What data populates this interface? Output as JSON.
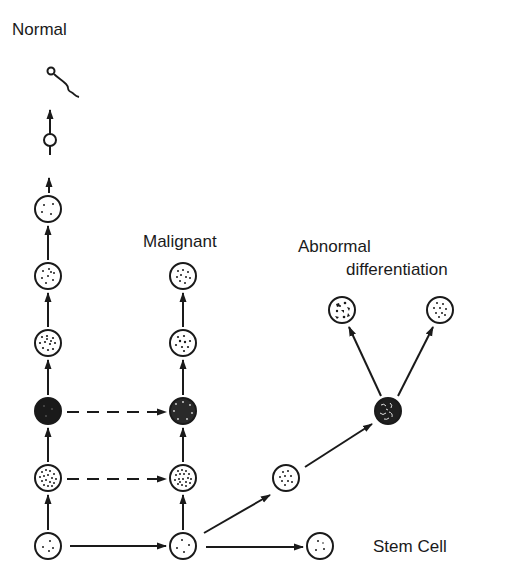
{
  "labels": {
    "normal": "Normal",
    "malignant": "Malignant",
    "abnormal_line1": "Abnormal",
    "abnormal_line2": "differentiation",
    "stem_cell": "Stem Cell"
  },
  "colors": {
    "ink": "#1a1a1a",
    "background": "#ffffff"
  },
  "nodes": [
    {
      "id": "sperm",
      "column": "normal",
      "type": "sperm-cell",
      "x": 49,
      "y": 100
    },
    {
      "id": "n1",
      "column": "normal",
      "type": "small-empty",
      "x": 50,
      "y": 168
    },
    {
      "id": "n2",
      "column": "normal",
      "type": "sparse-dots",
      "x": 48,
      "y": 209
    },
    {
      "id": "n3",
      "column": "normal",
      "type": "light-dots",
      "x": 48,
      "y": 276
    },
    {
      "id": "n4",
      "column": "normal",
      "type": "medium-dots",
      "x": 48,
      "y": 343
    },
    {
      "id": "n5",
      "column": "normal",
      "type": "solid-dark",
      "x": 48,
      "y": 411
    },
    {
      "id": "n6",
      "column": "normal",
      "type": "dense-dots",
      "x": 48,
      "y": 478
    },
    {
      "id": "n7",
      "column": "normal",
      "type": "stem",
      "x": 48,
      "y": 546
    },
    {
      "id": "m1",
      "column": "malignant",
      "type": "light-dots",
      "x": 183,
      "y": 276
    },
    {
      "id": "m2",
      "column": "malignant",
      "type": "medium-dots",
      "x": 183,
      "y": 343
    },
    {
      "id": "m3",
      "column": "malignant",
      "type": "dark-dots",
      "x": 183,
      "y": 411
    },
    {
      "id": "m4",
      "column": "malignant",
      "type": "dense-dots",
      "x": 183,
      "y": 478
    },
    {
      "id": "m5",
      "column": "malignant",
      "type": "stem",
      "x": 183,
      "y": 546
    },
    {
      "id": "a0",
      "column": "abnormal",
      "type": "light-dots",
      "x": 286,
      "y": 478
    },
    {
      "id": "a1",
      "column": "abnormal",
      "type": "dark-blotched",
      "x": 388,
      "y": 411
    },
    {
      "id": "a2",
      "column": "abnormal",
      "type": "blotched",
      "x": 342,
      "y": 310
    },
    {
      "id": "a3",
      "column": "abnormal",
      "type": "light-dots",
      "x": 440,
      "y": 310
    },
    {
      "id": "s1",
      "column": "stem",
      "type": "stem",
      "x": 320,
      "y": 546
    }
  ],
  "edges": [
    {
      "from": "n7",
      "to": "n6",
      "style": "solid"
    },
    {
      "from": "n6",
      "to": "n5",
      "style": "solid"
    },
    {
      "from": "n5",
      "to": "n4",
      "style": "solid"
    },
    {
      "from": "n4",
      "to": "n3",
      "style": "solid"
    },
    {
      "from": "n3",
      "to": "n2",
      "style": "solid"
    },
    {
      "from": "n2",
      "to": "n1",
      "style": "solid"
    },
    {
      "from": "n1",
      "to": "sperm",
      "style": "solid"
    },
    {
      "from": "n7",
      "to": "m5",
      "style": "solid"
    },
    {
      "from": "m5",
      "to": "m4",
      "style": "solid"
    },
    {
      "from": "m4",
      "to": "m3",
      "style": "solid"
    },
    {
      "from": "m3",
      "to": "m2",
      "style": "solid"
    },
    {
      "from": "m2",
      "to": "m1",
      "style": "solid"
    },
    {
      "from": "n6",
      "to": "m4",
      "style": "dashed"
    },
    {
      "from": "n5",
      "to": "m3",
      "style": "dashed"
    },
    {
      "from": "m5",
      "to": "a0",
      "style": "solid"
    },
    {
      "from": "a0",
      "to": "a1",
      "style": "solid"
    },
    {
      "from": "a1",
      "to": "a2",
      "style": "solid"
    },
    {
      "from": "a1",
      "to": "a3",
      "style": "solid"
    },
    {
      "from": "m5",
      "to": "s1",
      "style": "solid"
    }
  ]
}
